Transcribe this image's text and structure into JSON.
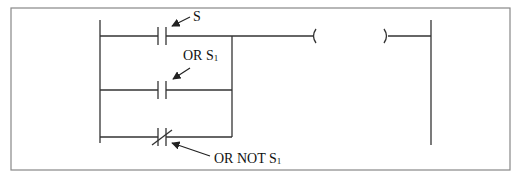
{
  "diagram": {
    "type": "ladder-logic",
    "colors": {
      "line": "#333333",
      "frame": "#888888",
      "background": "#ffffff"
    },
    "labels": {
      "s": {
        "text": "S"
      },
      "or_s1": {
        "prefix": "OR S",
        "subscript": "1"
      },
      "or_not_s1": {
        "prefix": "OR NOT S",
        "subscript": "1"
      }
    },
    "elements": [
      {
        "id": "contact-s",
        "kind": "normally-open-contact",
        "rung": 1,
        "label": "S"
      },
      {
        "id": "contact-s1",
        "kind": "normally-open-contact",
        "rung": 2,
        "label": "OR S1"
      },
      {
        "id": "contact-not-s1",
        "kind": "normally-closed-contact",
        "rung": 3,
        "label": "OR NOT S1"
      },
      {
        "id": "output-coil",
        "kind": "coil",
        "rung": 1,
        "label": ""
      }
    ]
  }
}
